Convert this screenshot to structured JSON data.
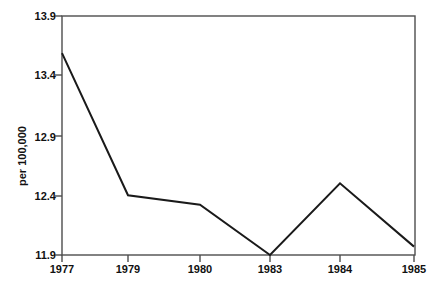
{
  "chart_data": {
    "type": "line",
    "title": "",
    "subtitle": "",
    "xlabel": "",
    "ylabel": "per 100,000",
    "categories": [
      "1977",
      "1979",
      "1980",
      "1983",
      "1984",
      "1985"
    ],
    "x": [
      1977,
      1979,
      1980,
      1983,
      1984,
      1985
    ],
    "values": [
      13.59,
      12.4,
      12.32,
      11.9,
      12.5,
      11.97
    ],
    "series": [
      {
        "name": "rate",
        "values": [
          13.59,
          12.4,
          12.32,
          11.9,
          12.5,
          11.97
        ]
      }
    ],
    "ylim": [
      11.9,
      13.9
    ],
    "yticks": [
      "11.9",
      "12.4",
      "12.9",
      "13.4",
      "13.9"
    ],
    "ytick_values": [
      11.9,
      12.4,
      12.9,
      13.4,
      13.9
    ],
    "xticks": [
      "1977",
      "1979",
      "1980",
      "1983",
      "1984",
      "1985"
    ],
    "grid": false,
    "legend": null,
    "legend_position": "none",
    "line_color": "#1a1a1a",
    "frame_color": "#4d4d4d",
    "background_color": "#ffffff",
    "markers": false,
    "annotations": []
  },
  "axis": {
    "y_label_text": "per 100,000",
    "y_ticks": [
      {
        "label": "13.9",
        "value": 13.9
      },
      {
        "label": "13.4",
        "value": 13.4
      },
      {
        "label": "12.9",
        "value": 12.9
      },
      {
        "label": "12.4",
        "value": 12.4
      },
      {
        "label": "11.9",
        "value": 11.9
      }
    ],
    "x_ticks": [
      {
        "label": "1977"
      },
      {
        "label": "1979"
      },
      {
        "label": "1980"
      },
      {
        "label": "1983"
      },
      {
        "label": "1984"
      },
      {
        "label": "1985"
      }
    ]
  }
}
